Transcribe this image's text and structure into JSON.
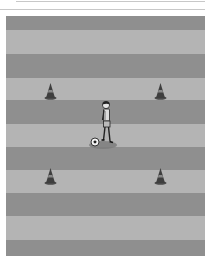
{
  "diagram": {
    "type": "soccer-drill",
    "colors": {
      "stripe_dark": "#8f8f8f",
      "stripe_light": "#b4b4b4",
      "rule": "#c8c8c8",
      "cone": "#3e3e3e",
      "cone_band": "#8a8a8a",
      "player_shadow": "#7d7d7d"
    },
    "stripes": [
      {
        "top": 0,
        "height": 14,
        "tone": "dark"
      },
      {
        "top": 14,
        "height": 24,
        "tone": "light"
      },
      {
        "top": 38,
        "height": 24,
        "tone": "dark"
      },
      {
        "top": 62,
        "height": 22,
        "tone": "light"
      },
      {
        "top": 84,
        "height": 24,
        "tone": "dark"
      },
      {
        "top": 108,
        "height": 23,
        "tone": "light"
      },
      {
        "top": 131,
        "height": 23,
        "tone": "dark"
      },
      {
        "top": 154,
        "height": 23,
        "tone": "light"
      },
      {
        "top": 177,
        "height": 23,
        "tone": "dark"
      },
      {
        "top": 200,
        "height": 24,
        "tone": "light"
      },
      {
        "top": 224,
        "height": 16,
        "tone": "dark"
      }
    ],
    "cones": [
      {
        "id": "cone-top-left",
        "x": 44,
        "y": 83
      },
      {
        "id": "cone-top-right",
        "x": 154,
        "y": 83
      },
      {
        "id": "cone-bottom-left",
        "x": 44,
        "y": 168
      },
      {
        "id": "cone-bottom-right",
        "x": 154,
        "y": 168
      }
    ],
    "player": {
      "x": 88,
      "y": 100,
      "has_ball": true
    }
  }
}
